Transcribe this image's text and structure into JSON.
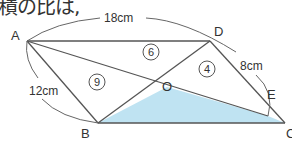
{
  "header_text": "積の比は,",
  "figure": {
    "colors": {
      "line": "#555555",
      "shade": "#bfe3f2",
      "text": "#333333"
    },
    "points": {
      "A": {
        "label": "A",
        "x": 27,
        "y": 41
      },
      "D": {
        "label": "D",
        "x": 210,
        "y": 41
      },
      "B": {
        "label": "B",
        "x": 98,
        "y": 123
      },
      "C": {
        "label": "C",
        "x": 285,
        "y": 123
      },
      "E": {
        "label": "E",
        "x": 268,
        "y": 116
      },
      "O": {
        "label": "O",
        "x": 167,
        "y": 87
      }
    },
    "dimensions": {
      "AD": "18cm",
      "AB": "12cm",
      "DE": "8cm"
    },
    "area_ratios": {
      "AOD": "6",
      "ABO": "9",
      "DOE": "4"
    },
    "shaded_region": "OBCE"
  }
}
